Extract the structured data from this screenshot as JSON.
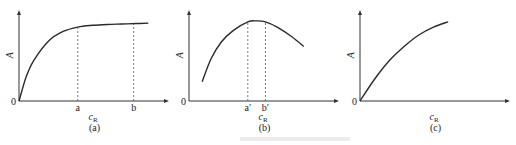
{
  "chart_data": [
    {
      "type": "line",
      "panel_label": "(a)",
      "xlabel": "c_R",
      "ylabel": "A",
      "origin_label": "0",
      "x_marks": [
        {
          "label": "a",
          "x": 0.4
        },
        {
          "label": "b",
          "x": 0.78
        }
      ],
      "curve": "saturating rise from origin, plateau after a",
      "series": [
        {
          "name": "A",
          "x": [
            0,
            0.05,
            0.1,
            0.2,
            0.3,
            0.4,
            0.5,
            0.6,
            0.7,
            0.8,
            0.88
          ],
          "y": [
            0,
            0.28,
            0.46,
            0.68,
            0.79,
            0.84,
            0.86,
            0.87,
            0.875,
            0.88,
            0.885
          ]
        }
      ],
      "xlim": [
        0,
        1
      ],
      "ylim": [
        0,
        1
      ]
    },
    {
      "type": "line",
      "panel_label": "(b)",
      "xlabel": "c_R",
      "ylabel": "A",
      "origin_label": "0",
      "x_marks": [
        {
          "label": "a′",
          "x": 0.4
        },
        {
          "label": "b′",
          "x": 0.52
        }
      ],
      "curve": "rises to maximum plateau between a′ and b′, then decreases",
      "series": [
        {
          "name": "A",
          "x": [
            0.09,
            0.15,
            0.22,
            0.3,
            0.4,
            0.46,
            0.52,
            0.6,
            0.7,
            0.78
          ],
          "y": [
            0.22,
            0.48,
            0.67,
            0.8,
            0.9,
            0.91,
            0.9,
            0.84,
            0.73,
            0.62
          ]
        }
      ],
      "xlim": [
        0,
        1
      ],
      "ylim": [
        0,
        1
      ]
    },
    {
      "type": "line",
      "panel_label": "(c)",
      "xlabel": "c_R",
      "ylabel": "A",
      "origin_label": "0",
      "x_marks": [],
      "curve": "monotonic concave increase from origin",
      "series": [
        {
          "name": "A",
          "x": [
            0,
            0.1,
            0.2,
            0.3,
            0.4,
            0.5,
            0.6
          ],
          "y": [
            0,
            0.25,
            0.46,
            0.62,
            0.75,
            0.84,
            0.9
          ]
        }
      ],
      "xlim": [
        0,
        1
      ],
      "ylim": [
        0,
        1
      ]
    }
  ]
}
